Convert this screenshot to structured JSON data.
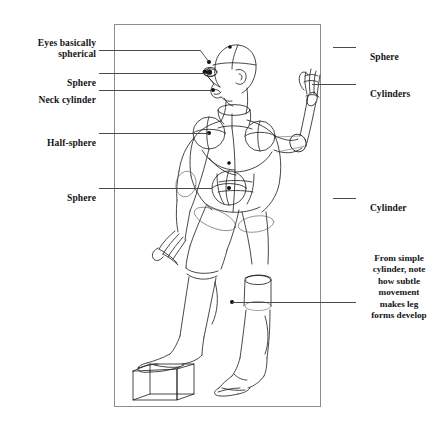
{
  "figure": {
    "frame": {
      "x": 114,
      "y": 24,
      "width": 207,
      "height": 383,
      "border_color": "#8d8d8d"
    },
    "background_color": "#ffffff",
    "ink_color": "#141414",
    "leader_color": "#4a4a4a"
  },
  "labels_left": [
    {
      "id": "eyes",
      "text": "Eyes basically\nspherical",
      "text_x": 96,
      "text_y": 26,
      "line_y": 50,
      "line_x1": 99,
      "line_x2": 200
    },
    {
      "id": "sphere-head",
      "text": "Sphere",
      "text_x": 96,
      "text_y": 66,
      "line_y": 73,
      "line_x1": 99,
      "line_x2": 206
    },
    {
      "id": "neck",
      "text": "Neck cylinder",
      "text_x": 96,
      "text_y": 83,
      "line_y": 90,
      "line_x1": 99,
      "line_x2": 212
    },
    {
      "id": "half-sphere",
      "text": "Half-sphere",
      "text_x": 96,
      "text_y": 126,
      "line_y": 133,
      "line_x1": 99,
      "line_x2": 209
    },
    {
      "id": "sphere-pelvis",
      "text": "Sphere",
      "text_x": 96,
      "text_y": 181,
      "line_y": 188,
      "line_x1": 99,
      "line_x2": 212
    }
  ],
  "labels_right": [
    {
      "id": "sphere-skull",
      "text": "Sphere",
      "text_x": 360,
      "text_y": 40,
      "line_y": 47,
      "line_x1": 333,
      "line_x2": 356
    },
    {
      "id": "cylinders-arm",
      "text": "Cylinders",
      "text_x": 360,
      "text_y": 77,
      "line_y": 84,
      "line_x1": 312,
      "line_x2": 356
    },
    {
      "id": "cylinder-leg",
      "text": "Cylinder",
      "text_x": 360,
      "text_y": 191,
      "line_y": 198,
      "line_x1": 333,
      "line_x2": 356
    }
  ],
  "note": {
    "id": "leg-forms-note",
    "text": "From simple\ncylinder, note\nhow subtle\nmovement\nmakes leg\nforms develop",
    "x": 356,
    "y": 253,
    "leader": {
      "line_y": 302,
      "line_x1": 232,
      "line_x2": 356
    }
  },
  "markers": [
    {
      "id": "eye-dot",
      "x": 209,
      "y": 62,
      "r": 2.0
    },
    {
      "id": "skull-dot",
      "x": 230,
      "y": 47,
      "r": 1.8
    },
    {
      "id": "jaw-dot",
      "x": 205,
      "y": 72,
      "r": 2.2
    },
    {
      "id": "neck-dot",
      "x": 213,
      "y": 90,
      "r": 2.0
    },
    {
      "id": "chest-dot",
      "x": 209,
      "y": 133,
      "r": 2.0
    },
    {
      "id": "abdomen-dot",
      "x": 229,
      "y": 163,
      "r": 1.8
    },
    {
      "id": "pelvis-dot",
      "x": 229,
      "y": 188,
      "r": 2.0
    },
    {
      "id": "knee-dot",
      "x": 232,
      "y": 302,
      "r": 2.0
    }
  ]
}
